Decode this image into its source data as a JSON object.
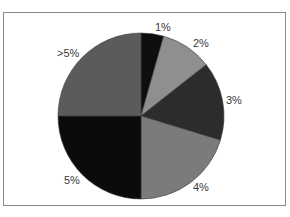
{
  "chart_data": {
    "type": "pie",
    "title": "",
    "start_angle_deg": 0,
    "direction": "clockwise",
    "categories": [
      "1%",
      "2%",
      "3%",
      "4%",
      "5%",
      ">5%"
    ],
    "values": [
      4.4,
      10.0,
      15.3,
      20.3,
      25.0,
      25.0
    ],
    "colors": [
      "#0e0e0e",
      "#8f8f8f",
      "#2c2c2c",
      "#7b7b7b",
      "#0b0b0b",
      "#5b5b5b"
    ],
    "legend": "none (labels adjacent to slices)",
    "labels": [
      {
        "text": "1%",
        "x": 155,
        "y": 21
      },
      {
        "text": "2%",
        "x": 193,
        "y": 37
      },
      {
        "text": "3%",
        "x": 226,
        "y": 94
      },
      {
        "text": "4%",
        "x": 193,
        "y": 181
      },
      {
        "text": "5%",
        "x": 64,
        "y": 174
      },
      {
        "text": ">5%",
        "x": 57,
        "y": 47
      }
    ]
  },
  "pie": {
    "cx": 141,
    "cy": 116,
    "r": 83
  }
}
